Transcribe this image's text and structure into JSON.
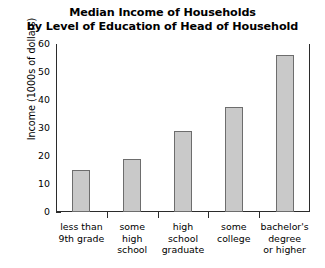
{
  "chart_data": {
    "type": "bar",
    "title": "Median Income of Households by Level of Education of Head of Household",
    "title_line1": "Median Income of Households",
    "title_line2": "by Level of Education of Head of Household",
    "xlabel": "",
    "ylabel": "Income (1000s of dollars)",
    "ylim": [
      0,
      60
    ],
    "yticks": [
      0,
      10,
      20,
      30,
      40,
      50,
      60
    ],
    "grid": false,
    "legend": false,
    "categories": [
      "less than 9th grade",
      "some high school",
      "high school graduate",
      "some college",
      "bachelor's degree or higher"
    ],
    "category_lines": [
      [
        "less than",
        "9th grade"
      ],
      [
        "some",
        "high",
        "school"
      ],
      [
        "high",
        "school",
        "graduate"
      ],
      [
        "some",
        "college"
      ],
      [
        "bachelor's",
        "degree",
        "or higher"
      ]
    ],
    "values": [
      15,
      19,
      29,
      37.5,
      56
    ],
    "bar_fill_color": "#c9c9c9",
    "bar_edge_color": "#6d6d6d",
    "axis_color": "#2b2b2b",
    "background_color": "#ffffff"
  }
}
